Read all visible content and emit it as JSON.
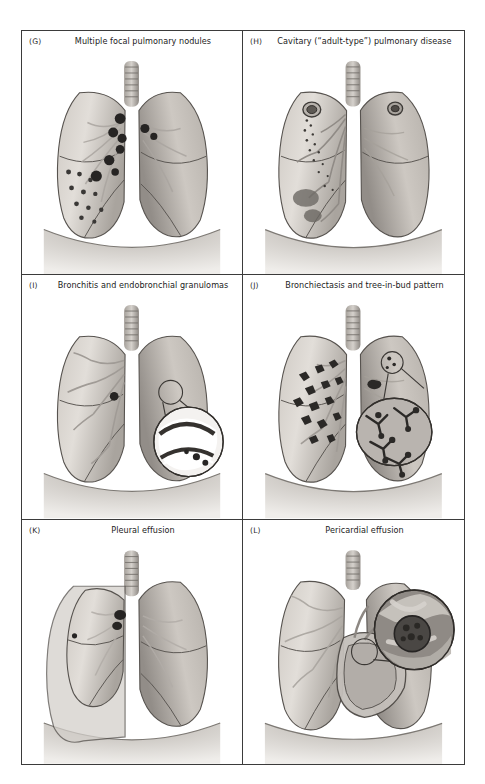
{
  "figure": {
    "panels": [
      {
        "letter": "(G)",
        "title": "Multiple focal pulmonary nodules",
        "art": "multiple-focal-pulmonary-nodules"
      },
      {
        "letter": "(H)",
        "title": "Cavitary (“adult-type”) pulmonary disease",
        "art": "cavitary-adult-type-pulmonary-disease"
      },
      {
        "letter": "(I)",
        "title": "Bronchitis and endobronchial granulomas",
        "art": "bronchitis-and-endobronchial-granulomas"
      },
      {
        "letter": "(J)",
        "title": "Bronchiectasis and tree-in-bud pattern",
        "art": "bronchiectasis-and-tree-in-bud-pattern"
      },
      {
        "letter": "(K)",
        "title": "Pleural effusion",
        "art": "pleural-effusion"
      },
      {
        "letter": "(L)",
        "title": "Pericardial effusion",
        "art": "pericardial-effusion"
      }
    ],
    "caption": ""
  },
  "palette": {
    "frame_line": "#3b3b3b",
    "lung_light": "#d8d4cf",
    "lung_mid": "#bdb8b2",
    "lung_shadow": "#8e8ا8",
    "lung_dark": "#6f6b66",
    "lesion_dark": "#262423",
    "outline": "#4a4744",
    "effusion_fill": "#cfcbc6",
    "background": "#ffffff"
  }
}
